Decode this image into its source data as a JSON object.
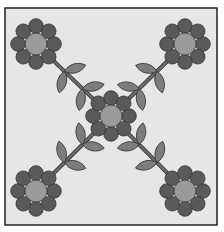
{
  "illustration": {
    "subject": "quilt-block-flowers",
    "colors": {
      "background": "#e6e6e6",
      "border": "#222222",
      "petal": "#5a5a5a",
      "center": "#9a9a9a",
      "leaf": "#7d7d7d",
      "stem": "#6a6a6a",
      "outline": "#333333"
    },
    "flowers": [
      {
        "name": "flower-top-left",
        "cx": 36,
        "cy": 44
      },
      {
        "name": "flower-top-right",
        "cx": 185,
        "cy": 44
      },
      {
        "name": "flower-center",
        "cx": 111,
        "cy": 116
      },
      {
        "name": "flower-bottom-left",
        "cx": 36,
        "cy": 191
      },
      {
        "name": "flower-bottom-right",
        "cx": 185,
        "cy": 191
      }
    ]
  }
}
